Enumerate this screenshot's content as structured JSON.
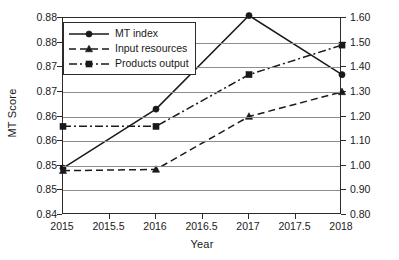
{
  "chart_data": {
    "type": "line",
    "title": "",
    "xlabel": "Year",
    "ylabel": "MT Score",
    "ylabel_right": "",
    "x": [
      2015,
      2016,
      2017,
      2018
    ],
    "xlim": [
      2015,
      2018
    ],
    "xticks": [
      "2015",
      "2015.5",
      "2016",
      "2016.5",
      "2017",
      "2017.5",
      "2018"
    ],
    "xtick_values": [
      2015,
      2015.5,
      2016,
      2016.5,
      2017,
      2017.5,
      2018
    ],
    "ylim": [
      0.84,
      0.88
    ],
    "yticks": [
      "0.88",
      "0.88",
      "0.87",
      "0.87",
      "0.86",
      "0.86",
      "0.85",
      "0.85",
      "0.84"
    ],
    "ytick_values": [
      0.88,
      0.875,
      0.87,
      0.865,
      0.86,
      0.855,
      0.85,
      0.845,
      0.84
    ],
    "ylim_right": [
      0.8,
      1.6
    ],
    "yticks_right": [
      "1.60",
      "1.50",
      "1.40",
      "1.30",
      "1.20",
      "1.10",
      "1.00",
      "0.90",
      "0.80"
    ],
    "ytick_values_right": [
      1.6,
      1.5,
      1.4,
      1.3,
      1.2,
      1.1,
      1.0,
      0.9,
      0.8
    ],
    "grid": true,
    "legend_position": "upper left",
    "series": [
      {
        "name": "MT index",
        "axis": "left",
        "marker": "circle",
        "linestyle": "solid",
        "color": "#1a1a1a",
        "values": [
          0.8495,
          0.8615,
          0.8805,
          0.8685
        ]
      },
      {
        "name": "Input resources",
        "axis": "right",
        "marker": "triangle",
        "linestyle": "dashed",
        "color": "#1a1a1a",
        "values": [
          0.98,
          0.985,
          1.2,
          1.3
        ]
      },
      {
        "name": "Products output",
        "axis": "right",
        "marker": "square",
        "linestyle": "dashdot",
        "color": "#1a1a1a",
        "values": [
          1.16,
          1.16,
          1.37,
          1.49
        ]
      }
    ]
  },
  "legend": {
    "items": [
      {
        "label": "MT index"
      },
      {
        "label": "Input resources"
      },
      {
        "label": "Products output"
      }
    ]
  },
  "axes": {
    "y_left_title": "MT Score",
    "x_title": "Year"
  }
}
